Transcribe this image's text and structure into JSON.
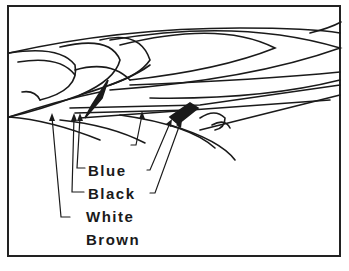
{
  "diagram": {
    "type": "feather layer diagram (bird wing)",
    "labels": [
      {
        "id": "blue",
        "text": "Blue"
      },
      {
        "id": "black",
        "text": "Black"
      },
      {
        "id": "white",
        "text": "White"
      },
      {
        "id": "brown",
        "text": "Brown"
      }
    ],
    "colors": {
      "ink": "#1a1a1a",
      "background": "#ffffff"
    }
  }
}
